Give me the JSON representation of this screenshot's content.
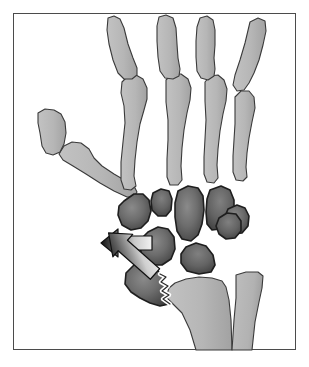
{
  "figure": {
    "title": "Wrist skeleton diagram with displacement arrows",
    "caption": "",
    "type": "anatomical-line-illustration",
    "view": "posteroanterior (PA) right wrist"
  },
  "frame": {
    "border_color": "#4b4b4b",
    "background": "#ffffff",
    "x": 13,
    "y": 13,
    "width": 283,
    "height": 337
  },
  "palette": {
    "light_bone_fill": "#b9b9b9",
    "light_bone_fill_shade": "#a7a7a7",
    "light_bone_stroke": "#3a3a3a",
    "carpal_fill_center": "#6e6e6e",
    "carpal_fill_edge": "#3f3f3f",
    "carpal_stroke": "#1e1e1e",
    "arrow_tip": "#1a1a1a",
    "arrow_tail": "#efefef",
    "arrow_stroke": "#111111",
    "outline_halo": "#ffffff",
    "background": "#ffffff"
  },
  "bones": {
    "phalanges": [
      {
        "name": "proximal-phalanx-index",
        "label": "Proximal phalanx (index)"
      },
      {
        "name": "proximal-phalanx-middle",
        "label": "Proximal phalanx (middle)"
      },
      {
        "name": "proximal-phalanx-ring",
        "label": "Proximal phalanx (ring)"
      },
      {
        "name": "proximal-phalanx-little",
        "label": "Proximal phalanx (little)"
      },
      {
        "name": "proximal-phalanx-thumb",
        "label": "Proximal phalanx (thumb)"
      }
    ],
    "metacarpals": [
      {
        "name": "metacarpal-2",
        "label": "Second metacarpal"
      },
      {
        "name": "metacarpal-3",
        "label": "Third metacarpal"
      },
      {
        "name": "metacarpal-4",
        "label": "Fourth metacarpal"
      },
      {
        "name": "metacarpal-5",
        "label": "Fifth metacarpal"
      },
      {
        "name": "metacarpal-1",
        "label": "First metacarpal (thumb)"
      }
    ],
    "carpals": [
      {
        "name": "trapezium",
        "label": "Trapezium"
      },
      {
        "name": "trapezoid",
        "label": "Trapezoid"
      },
      {
        "name": "capitate",
        "label": "Capitate"
      },
      {
        "name": "hamate",
        "label": "Hamate"
      },
      {
        "name": "scaphoid-proximal-pole",
        "label": "Scaphoid proximal pole"
      },
      {
        "name": "scaphoid-distal-fragment",
        "label": "Scaphoid distal fragment (displaced)"
      },
      {
        "name": "lunate",
        "label": "Lunate"
      },
      {
        "name": "triquetrum",
        "label": "Triquetrum"
      },
      {
        "name": "pisiform",
        "label": "Pisiform"
      }
    ],
    "forearm": [
      {
        "name": "radius",
        "label": "Radius"
      },
      {
        "name": "ulna",
        "label": "Ulna"
      }
    ]
  },
  "fracture": {
    "name": "scaphoid-fracture-line",
    "label": "Jagged fracture line",
    "style": "zigzag"
  },
  "arrows": [
    {
      "name": "displacement-arrow-proximal",
      "label": "Proximal row displacement",
      "direction": "left",
      "angle_deg": 180,
      "tip_x": 101,
      "tip_y": 243,
      "tail_x": 152,
      "tail_y": 243
    },
    {
      "name": "displacement-arrow-distal",
      "label": "Distal fragment displacement",
      "direction": "down-left",
      "angle_deg": 222,
      "tip_x": 104,
      "tip_y": 313,
      "tail_x": 155,
      "tail_y": 274
    }
  ]
}
